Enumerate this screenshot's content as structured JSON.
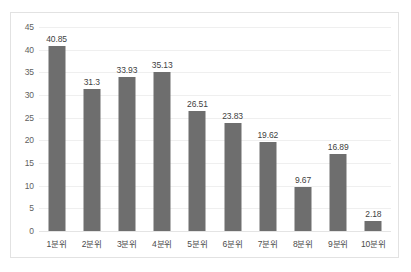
{
  "chart_data": {
    "type": "bar",
    "title": "",
    "xlabel": "",
    "ylabel": "",
    "categories": [
      "1분위",
      "2분위",
      "3분위",
      "4분위",
      "5분위",
      "6분위",
      "7분위",
      "8분위",
      "9분위",
      "10분위"
    ],
    "values": [
      40.85,
      31.3,
      33.93,
      35.13,
      26.51,
      23.83,
      19.62,
      9.67,
      16.89,
      2.18
    ],
    "value_labels": [
      "40.85",
      "31.3",
      "33.93",
      "35.13",
      "26.51",
      "23.83",
      "19.62",
      "9.67",
      "16.89",
      "2.18"
    ],
    "ylim": [
      0,
      45
    ],
    "yticks": [
      0,
      5,
      10,
      15,
      20,
      25,
      30,
      35,
      40,
      45
    ],
    "ytick_labels": [
      "0",
      "5",
      "10",
      "15",
      "20",
      "25",
      "30",
      "35",
      "40",
      "45"
    ],
    "grid": true,
    "legend": false,
    "legend_position": "none",
    "series_color": "#6e6e6e",
    "gridline_color": "#efefef",
    "border_color": "#e2e2e2",
    "data_label_color": "#3f3f3f"
  }
}
